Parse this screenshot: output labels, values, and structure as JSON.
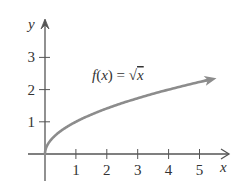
{
  "chart_data": {
    "type": "line",
    "title": "",
    "function_label": "f(x) = √x",
    "function_label_parts": {
      "lhs": "f(x) = ",
      "radical": "√",
      "radicand": "x"
    },
    "xlabel": "x",
    "ylabel": "y",
    "xlim": [
      0,
      5.8
    ],
    "ylim": [
      -0.6,
      4.2
    ],
    "x_ticks": [
      1,
      2,
      3,
      4,
      5
    ],
    "y_ticks": [
      1,
      2,
      3
    ],
    "x_tick_labels": [
      "1",
      "2",
      "3",
      "4",
      "5"
    ],
    "y_tick_labels": [
      "1",
      "2",
      "3"
    ],
    "grid": false,
    "legend": null,
    "series": [
      {
        "name": "f(x) = √x",
        "x": [
          0,
          0.1,
          0.25,
          0.5,
          1,
          1.5,
          2,
          2.5,
          3,
          3.5,
          4,
          4.5,
          5,
          5.55
        ],
        "values": [
          0,
          0.316,
          0.5,
          0.707,
          1,
          1.225,
          1.414,
          1.581,
          1.732,
          1.871,
          2,
          2.121,
          2.236,
          2.356
        ],
        "color": "#8c8c8c",
        "end_arrow": true
      }
    ]
  },
  "colors": {
    "axis": "#555555",
    "curve": "#8c8c8c",
    "text": "#333333"
  }
}
